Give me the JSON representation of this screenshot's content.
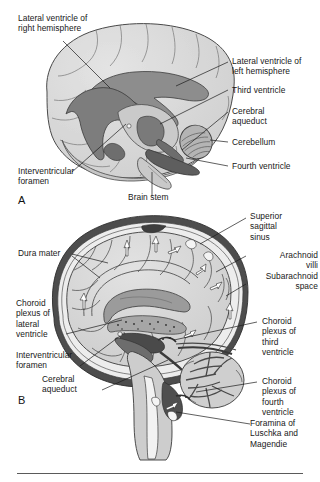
{
  "figure": {
    "type": "anatomical-illustration",
    "style": "grayscale line-and-tone medical drawing",
    "panels": [
      {
        "id": "A",
        "letter": "A",
        "caption": "Lateral three-dimensional view of the brain showing the ventricular system",
        "labels": [
          "Lateral ventricle of\nright hemisphere",
          "Lateral ventricle of\nleft hemisphere",
          "Third ventricle",
          "Cerebral\naqueduct",
          "Cerebellum",
          "Fourth ventricle",
          "Interventricular\nforamen",
          "Brain stem"
        ]
      },
      {
        "id": "B",
        "letter": "B",
        "caption": "Midsagittal section showing cerebrospinal fluid flow through the meninges",
        "labels": [
          "Dura mater",
          "Superior\nsagittal\nsinus",
          "Arachnoid\nvilli",
          "Subarachnoid\nspace",
          "Choroid\nplexus of\nlateral\nventricle",
          "Interventricular\nforamen",
          "Cerebral\naqueduct",
          "Choroid\nplexus of\nthird\nventricle",
          "Choroid\nplexus of\nfourth\nventricle",
          "Foramina of\nLuschka and\nMagendie"
        ]
      }
    ],
    "labels_a": {
      "lateral_ventricle_right": "Lateral ventricle of\nright hemisphere",
      "lateral_ventricle_left": "Lateral ventricle of\nleft hemisphere",
      "third_ventricle": "Third ventricle",
      "cerebral_aqueduct": "Cerebral\naqueduct",
      "cerebellum": "Cerebellum",
      "fourth_ventricle": "Fourth ventricle",
      "interventricular_foramen": "Interventricular\nforamen",
      "brain_stem": "Brain stem",
      "panel_letter": "A"
    },
    "labels_b": {
      "dura_mater": "Dura mater",
      "superior_sagittal_sinus": "Superior\nsagittal\nsinus",
      "arachnoid_villi": "Arachnoid\nvilli",
      "subarachnoid_space": "Subarachnoid\nspace",
      "choroid_plexus_lateral": "Choroid\nplexus of\nlateral\nventricle",
      "interventricular_foramen": "Interventricular\nforamen",
      "cerebral_aqueduct": "Cerebral\naqueduct",
      "choroid_plexus_third": "Choroid\nplexus of\nthird\nventricle",
      "choroid_plexus_fourth": "Choroid\nplexus of\nfourth\nventricle",
      "foramina_luschka_magendie": "Foramina of\nLuschka and\nMagendie",
      "panel_letter": "B"
    },
    "colors": {
      "background": "#ffffff",
      "text": "#181818",
      "leader_line": "#1b1b1b",
      "brain_light": "#d9d9d9",
      "brain_mid": "#bdbdbd",
      "brain_shadow": "#a8a8a8",
      "ventricle_dark": "#8a8a8a",
      "ventricle_darker": "#6f6f6f",
      "dura": "#4a4a4a",
      "csf_white": "#f2f2f2",
      "outline": "#333333",
      "rule": "#5a5a5a"
    }
  }
}
